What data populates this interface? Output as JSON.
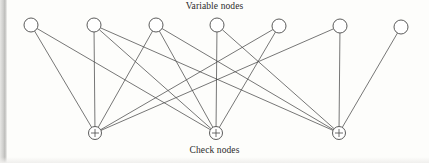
{
  "figure": {
    "type": "tanner-graph",
    "title_top": "Variable nodes",
    "title_bottom": "Check nodes",
    "background_color": "#fdfdfb",
    "line_color": "#4a4a4a",
    "node_stroke_color": "#4a4a4a",
    "node_fill_color": "#ffffff"
  },
  "variable_nodes": [
    {
      "id": "v1",
      "label": "",
      "cx": 31,
      "cy": 25,
      "r": 7
    },
    {
      "id": "v2",
      "label": "",
      "cx": 94,
      "cy": 25,
      "r": 7
    },
    {
      "id": "v3",
      "label": "",
      "cx": 156,
      "cy": 25,
      "r": 7
    },
    {
      "id": "v4",
      "label": "",
      "cx": 217,
      "cy": 25,
      "r": 7
    },
    {
      "id": "v5",
      "label": "",
      "cx": 279,
      "cy": 26,
      "r": 7
    },
    {
      "id": "v6",
      "label": "",
      "cx": 340,
      "cy": 26,
      "r": 7
    },
    {
      "id": "v7",
      "label": "",
      "cx": 401,
      "cy": 27,
      "r": 7
    }
  ],
  "check_nodes": [
    {
      "id": "c1",
      "symbol": "+",
      "cx": 95,
      "cy": 133,
      "r": 6.5
    },
    {
      "id": "c2",
      "symbol": "+",
      "cx": 216,
      "cy": 133,
      "r": 6.5
    },
    {
      "id": "c3",
      "symbol": "+",
      "cx": 339,
      "cy": 133,
      "r": 6.5
    }
  ],
  "edges": [
    {
      "from": "v1",
      "to": "c1"
    },
    {
      "from": "v1",
      "to": "c2"
    },
    {
      "from": "v2",
      "to": "c1"
    },
    {
      "from": "v2",
      "to": "c2"
    },
    {
      "from": "v2",
      "to": "c3"
    },
    {
      "from": "v3",
      "to": "c1"
    },
    {
      "from": "v3",
      "to": "c2"
    },
    {
      "from": "v3",
      "to": "c3"
    },
    {
      "from": "v4",
      "to": "c2"
    },
    {
      "from": "v4",
      "to": "c3"
    },
    {
      "from": "v5",
      "to": "c1"
    },
    {
      "from": "v5",
      "to": "c2"
    },
    {
      "from": "v6",
      "to": "c1"
    },
    {
      "from": "v6",
      "to": "c3"
    },
    {
      "from": "v7",
      "to": "c3"
    }
  ],
  "chart_data": {
    "type": "diagram",
    "subtype": "bipartite-tanner-graph",
    "title": "",
    "top_layer_label": "Variable nodes",
    "bottom_layer_label": "Check nodes",
    "top_layer_count": 7,
    "bottom_layer_count": 3,
    "edge_count": 15,
    "adjacency": {
      "c1": [
        "v1",
        "v2",
        "v3",
        "v5",
        "v6"
      ],
      "c2": [
        "v1",
        "v2",
        "v3",
        "v4",
        "v5"
      ],
      "c3": [
        "v2",
        "v3",
        "v4",
        "v6",
        "v7"
      ]
    },
    "legend": [],
    "grid": false
  }
}
